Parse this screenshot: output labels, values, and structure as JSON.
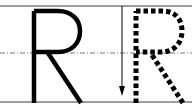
{
  "worksheet": {
    "letter": "R",
    "model_letter_label": "R",
    "trace_letter_label": "R",
    "stroke_hint": "down-arrow",
    "colors": {
      "ink": "#000000",
      "guide_line": "#3a3a3a",
      "midline": "#7a7a7a",
      "background": "#ffffff"
    },
    "guides": {
      "top_y": 6,
      "mid_y": 53,
      "bottom_y": 102
    }
  }
}
